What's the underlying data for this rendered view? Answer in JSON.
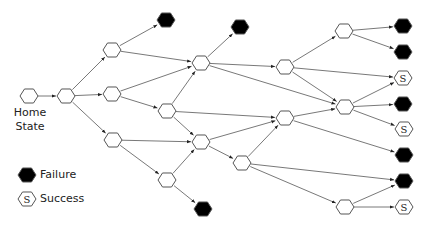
{
  "home_label_line1": "Home",
  "home_label_line2": "State",
  "legend": {
    "failure_label": "Failure",
    "success_label": "Success",
    "success_glyph": "S"
  },
  "colors": {
    "stroke": "#555555",
    "failure_fill": "#000000",
    "node_fill": "#ffffff",
    "text": "#222222"
  },
  "nodes": [
    {
      "id": "home",
      "type": "state",
      "x": 29,
      "y": 96
    },
    {
      "id": "A",
      "type": "state",
      "x": 66,
      "y": 96
    },
    {
      "id": "B",
      "type": "state",
      "x": 112,
      "y": 50
    },
    {
      "id": "C",
      "type": "state",
      "x": 112,
      "y": 94
    },
    {
      "id": "D",
      "type": "state",
      "x": 113,
      "y": 140
    },
    {
      "id": "E",
      "type": "state",
      "x": 201,
      "y": 63
    },
    {
      "id": "G",
      "type": "state",
      "x": 167,
      "y": 111
    },
    {
      "id": "H",
      "type": "state",
      "x": 201,
      "y": 142
    },
    {
      "id": "I",
      "type": "state",
      "x": 167,
      "y": 180
    },
    {
      "id": "J",
      "type": "state",
      "x": 242,
      "y": 163
    },
    {
      "id": "F",
      "type": "state",
      "x": 285,
      "y": 67
    },
    {
      "id": "K",
      "type": "state",
      "x": 285,
      "y": 118
    },
    {
      "id": "L",
      "type": "state",
      "x": 344,
      "y": 31
    },
    {
      "id": "M",
      "type": "state",
      "x": 345,
      "y": 107
    },
    {
      "id": "N",
      "type": "state",
      "x": 345,
      "y": 207
    },
    {
      "id": "fB",
      "type": "failure",
      "x": 166,
      "y": 20
    },
    {
      "id": "fE",
      "type": "failure",
      "x": 240,
      "y": 27
    },
    {
      "id": "fI",
      "type": "failure",
      "x": 203,
      "y": 209
    },
    {
      "id": "f1",
      "type": "failure",
      "x": 403,
      "y": 26
    },
    {
      "id": "f2",
      "type": "failure",
      "x": 403,
      "y": 52
    },
    {
      "id": "s1",
      "type": "success",
      "x": 403,
      "y": 78
    },
    {
      "id": "f3",
      "type": "failure",
      "x": 403,
      "y": 104
    },
    {
      "id": "s2",
      "type": "success",
      "x": 404,
      "y": 129
    },
    {
      "id": "f4",
      "type": "failure",
      "x": 404,
      "y": 155
    },
    {
      "id": "f5",
      "type": "failure",
      "x": 404,
      "y": 181
    },
    {
      "id": "s3",
      "type": "success",
      "x": 404,
      "y": 207
    }
  ],
  "edges": [
    [
      "home",
      "A"
    ],
    [
      "A",
      "B"
    ],
    [
      "A",
      "C"
    ],
    [
      "A",
      "D"
    ],
    [
      "B",
      "fB"
    ],
    [
      "B",
      "E"
    ],
    [
      "C",
      "E"
    ],
    [
      "C",
      "G"
    ],
    [
      "D",
      "H"
    ],
    [
      "D",
      "I"
    ],
    [
      "G",
      "E"
    ],
    [
      "G",
      "K"
    ],
    [
      "G",
      "H"
    ],
    [
      "I",
      "H"
    ],
    [
      "I",
      "fI"
    ],
    [
      "E",
      "fE"
    ],
    [
      "E",
      "F"
    ],
    [
      "E",
      "M"
    ],
    [
      "H",
      "K"
    ],
    [
      "H",
      "J"
    ],
    [
      "J",
      "K"
    ],
    [
      "J",
      "f5"
    ],
    [
      "J",
      "N"
    ],
    [
      "F",
      "L"
    ],
    [
      "F",
      "s1"
    ],
    [
      "F",
      "M"
    ],
    [
      "K",
      "M"
    ],
    [
      "K",
      "f4"
    ],
    [
      "L",
      "f1"
    ],
    [
      "L",
      "f2"
    ],
    [
      "M",
      "s1"
    ],
    [
      "M",
      "f3"
    ],
    [
      "M",
      "s2"
    ],
    [
      "N",
      "f5"
    ],
    [
      "N",
      "s3"
    ]
  ],
  "legend_items": [
    {
      "type": "failure",
      "x": 27,
      "y": 175
    },
    {
      "type": "success",
      "x": 27,
      "y": 199
    }
  ]
}
